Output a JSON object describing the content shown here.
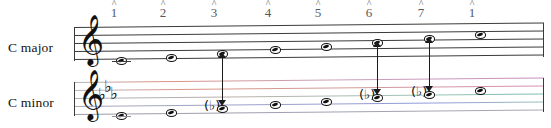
{
  "diagram": {
    "degrees": [
      {
        "caret": "^",
        "number": "1",
        "x": 114
      },
      {
        "caret": "^",
        "number": "2",
        "x": 163
      },
      {
        "caret": "^",
        "number": "3",
        "x": 214
      },
      {
        "caret": "^",
        "number": "4",
        "x": 268
      },
      {
        "caret": "^",
        "number": "5",
        "x": 318
      },
      {
        "caret": "^",
        "number": "6",
        "x": 369
      },
      {
        "caret": "^",
        "number": "7",
        "x": 421
      },
      {
        "caret": "^",
        "number": "1",
        "x": 472
      }
    ],
    "staves": [
      {
        "name": "c-major",
        "label": "C major",
        "clef": "treble-clef",
        "clef_glyph": "𝄞",
        "key_signature": [],
        "line_colors": [
          "#3b3b3b",
          "#3b3b3b",
          "#3b3b3b",
          "#3b3b3b",
          "#3b3b3b"
        ],
        "notes": [
          {
            "degree": "1",
            "x": 116,
            "y": 57,
            "accidental": ""
          },
          {
            "degree": "2",
            "x": 166,
            "y": 54,
            "accidental": ""
          },
          {
            "degree": "3",
            "x": 217,
            "y": 50,
            "accidental": ""
          },
          {
            "degree": "4",
            "x": 270,
            "y": 46,
            "accidental": ""
          },
          {
            "degree": "5",
            "x": 321,
            "y": 43,
            "accidental": ""
          },
          {
            "degree": "6",
            "x": 372,
            "y": 39,
            "accidental": ""
          },
          {
            "degree": "7",
            "x": 424,
            "y": 35,
            "accidental": ""
          },
          {
            "degree": "1",
            "x": 475,
            "y": 31,
            "accidental": ""
          }
        ]
      },
      {
        "name": "c-minor",
        "label": "C minor",
        "clef": "treble-clef",
        "clef_glyph": "𝄞",
        "key_signature": [
          "♭",
          "♭",
          "♭"
        ],
        "key_signature_name": "three-flats",
        "line_colors": [
          "#c58fc0",
          "#d99382",
          "#7fbcb0",
          "#8f9ad8",
          "#9a9aa8"
        ],
        "notes": [
          {
            "degree": "1",
            "x": 116,
            "y": 112,
            "accidental": ""
          },
          {
            "degree": "2",
            "x": 166,
            "y": 109,
            "accidental": ""
          },
          {
            "degree": "3",
            "x": 217,
            "y": 105,
            "accidental": "♭",
            "accidental_parenthesized": true
          },
          {
            "degree": "4",
            "x": 270,
            "y": 101,
            "accidental": ""
          },
          {
            "degree": "5",
            "x": 321,
            "y": 98,
            "accidental": ""
          },
          {
            "degree": "6",
            "x": 372,
            "y": 94,
            "accidental": "♭",
            "accidental_parenthesized": true
          },
          {
            "degree": "7",
            "x": 424,
            "y": 91,
            "accidental": "♭",
            "accidental_parenthesized": true
          },
          {
            "degree": "1",
            "x": 475,
            "y": 87,
            "accidental": ""
          }
        ]
      }
    ],
    "arrows": [
      {
        "name": "arrow-degree-3",
        "degree": "3",
        "x": 217,
        "top": 52,
        "bottom": 106,
        "style": "double-headed"
      },
      {
        "name": "arrow-degree-6",
        "degree": "6",
        "x": 372,
        "top": 41,
        "bottom": 95,
        "style": "double-headed"
      },
      {
        "name": "arrow-degree-7",
        "degree": "7",
        "x": 424,
        "top": 37,
        "bottom": 92,
        "style": "double-headed"
      }
    ],
    "accent_colors": {
      "staff_black": "#3b3b3b",
      "magenta": "#c58fc0",
      "salmon": "#d99382",
      "teal": "#7fbcb0",
      "blue": "#8f9ad8",
      "arrow": "#1b1b1b"
    }
  }
}
